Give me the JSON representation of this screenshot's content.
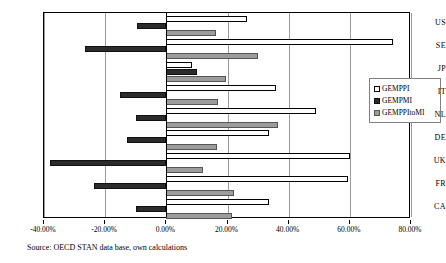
{
  "chart_data": {
    "type": "bar",
    "orientation": "horizontal",
    "title": "",
    "xlabel": "",
    "ylabel": "",
    "categories": [
      "US",
      "SE",
      "JP",
      "IT",
      "NL",
      "DE",
      "UK",
      "FR",
      "CA"
    ],
    "series": [
      {
        "name": "GEMPPI",
        "values": [
          26.5,
          74.0,
          8.5,
          36.0,
          49.0,
          33.5,
          60.0,
          59.5,
          33.5
        ]
      },
      {
        "name": "GEMPMI",
        "values": [
          -9.5,
          -26.5,
          10.0,
          -15.0,
          -10.0,
          -13.0,
          -38.0,
          -23.5,
          -10.0
        ]
      },
      {
        "name": "GEMPPItoMI",
        "values": [
          16.3,
          30.0,
          19.5,
          17.0,
          36.5,
          16.5,
          12.0,
          22.0,
          21.5
        ]
      }
    ],
    "xlim": [
      -40,
      80
    ],
    "xtick_values": [
      -40,
      -20,
      0,
      20,
      40,
      60,
      80
    ],
    "xtick_labels": [
      "-40.00%",
      "-20.00%",
      "0.00%",
      "20.00%",
      "40.00%",
      "60.00%",
      "80.00%"
    ],
    "xtick_format": "percent",
    "grid": true,
    "grid_axis": "x",
    "legend_position": "inside-right-upper",
    "series_colors": [
      "#ffffff",
      "#2b2b2b",
      "#9c9c9c"
    ]
  },
  "legend": {
    "items": [
      {
        "label": "GEMPPI"
      },
      {
        "label": "GEMPMI"
      },
      {
        "label": "GEMPPItoMI"
      }
    ]
  },
  "source": {
    "text": "Source: OECD STAN data base, own calculations"
  }
}
